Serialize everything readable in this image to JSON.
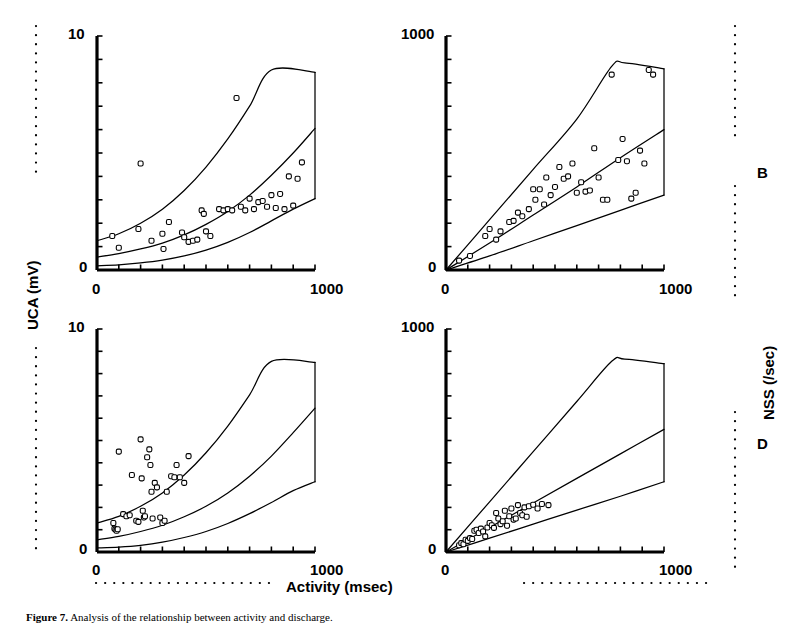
{
  "figure": {
    "caption_lead": "Figure 7.",
    "caption_rest": "Analysis of the relationship between activity and discharge."
  },
  "axes_titles": {
    "y_left": "UCA (mV)",
    "y_right": "NSS (/sec)",
    "x_bottom": "Activity (msec)"
  },
  "panel_letters": {
    "right_top": "B",
    "right_bottom": "D"
  },
  "ticks": {
    "uca_max": "10",
    "uca_min": "0",
    "nss_max": "1000",
    "nss_min": "0",
    "x_min": "0",
    "x_max": "1000"
  },
  "chart_data": [
    {
      "id": "panel-A",
      "type": "scatter",
      "title": "",
      "xlabel": "Activity (msec)",
      "ylabel": "UCA (mV)",
      "xlim": [
        0,
        1000
      ],
      "ylim": [
        0,
        10
      ],
      "grid": false,
      "legend": "none",
      "x_ticks": [
        "0",
        "1000"
      ],
      "y_ticks": [
        "0",
        "10"
      ],
      "x_minor_tick_count": 10,
      "y_minor_tick_count": 10,
      "marker": "open-square",
      "points": [
        [
          70,
          1.45
        ],
        [
          100,
          0.95
        ],
        [
          190,
          1.75
        ],
        [
          200,
          4.55
        ],
        [
          250,
          1.25
        ],
        [
          300,
          1.55
        ],
        [
          305,
          0.9
        ],
        [
          330,
          2.05
        ],
        [
          390,
          1.6
        ],
        [
          400,
          1.4
        ],
        [
          420,
          1.2
        ],
        [
          440,
          1.25
        ],
        [
          460,
          1.3
        ],
        [
          480,
          2.55
        ],
        [
          490,
          2.4
        ],
        [
          500,
          1.65
        ],
        [
          520,
          1.45
        ],
        [
          560,
          2.6
        ],
        [
          580,
          2.55
        ],
        [
          600,
          2.6
        ],
        [
          620,
          2.55
        ],
        [
          640,
          7.35
        ],
        [
          660,
          2.7
        ],
        [
          680,
          2.55
        ],
        [
          700,
          3.05
        ],
        [
          720,
          2.6
        ],
        [
          740,
          2.9
        ],
        [
          760,
          2.95
        ],
        [
          780,
          2.7
        ],
        [
          800,
          3.2
        ],
        [
          820,
          2.65
        ],
        [
          840,
          3.25
        ],
        [
          860,
          2.6
        ],
        [
          880,
          4.0
        ],
        [
          900,
          2.75
        ],
        [
          920,
          3.9
        ],
        [
          940,
          4.6
        ]
      ],
      "curves": [
        {
          "name": "upper-envelope",
          "points": [
            [
              0,
              1.25
            ],
            [
              100,
              1.55
            ],
            [
              200,
              2.0
            ],
            [
              300,
              2.6
            ],
            [
              400,
              3.4
            ],
            [
              500,
              4.4
            ],
            [
              600,
              5.6
            ],
            [
              700,
              7.0
            ],
            [
              800,
              8.55
            ],
            [
              1000,
              8.45
            ]
          ]
        },
        {
          "name": "median-fit",
          "points": [
            [
              0,
              0.55
            ],
            [
              100,
              0.7
            ],
            [
              200,
              0.9
            ],
            [
              300,
              1.15
            ],
            [
              400,
              1.5
            ],
            [
              500,
              1.95
            ],
            [
              600,
              2.5
            ],
            [
              700,
              3.2
            ],
            [
              800,
              4.05
            ],
            [
              900,
              5.0
            ],
            [
              1000,
              6.05
            ]
          ]
        },
        {
          "name": "lower-envelope",
          "points": [
            [
              0,
              0.18
            ],
            [
              100,
              0.22
            ],
            [
              200,
              0.3
            ],
            [
              300,
              0.42
            ],
            [
              400,
              0.6
            ],
            [
              500,
              0.85
            ],
            [
              600,
              1.18
            ],
            [
              700,
              1.6
            ],
            [
              800,
              2.1
            ],
            [
              900,
              2.6
            ],
            [
              1000,
              3.05
            ]
          ]
        },
        {
          "name": "right-closure",
          "points": [
            [
              1000,
              8.45
            ],
            [
              1000,
              3.05
            ]
          ]
        }
      ]
    },
    {
      "id": "panel-B",
      "type": "scatter",
      "title": "",
      "xlabel": "Activity (msec)",
      "ylabel": "NSS (/sec)",
      "xlim": [
        0,
        1000
      ],
      "ylim": [
        0,
        1000
      ],
      "grid": false,
      "legend": "none",
      "x_ticks": [
        "0",
        "1000"
      ],
      "y_ticks": [
        "0",
        "1000"
      ],
      "x_minor_tick_count": 10,
      "y_minor_tick_count": 10,
      "marker": "open-square",
      "points": [
        [
          60,
          40
        ],
        [
          110,
          60
        ],
        [
          180,
          145
        ],
        [
          200,
          175
        ],
        [
          230,
          130
        ],
        [
          250,
          165
        ],
        [
          290,
          205
        ],
        [
          310,
          210
        ],
        [
          330,
          245
        ],
        [
          350,
          230
        ],
        [
          380,
          260
        ],
        [
          400,
          345
        ],
        [
          410,
          300
        ],
        [
          430,
          345
        ],
        [
          450,
          280
        ],
        [
          460,
          395
        ],
        [
          480,
          320
        ],
        [
          500,
          355
        ],
        [
          520,
          440
        ],
        [
          540,
          390
        ],
        [
          560,
          400
        ],
        [
          580,
          455
        ],
        [
          600,
          330
        ],
        [
          620,
          375
        ],
        [
          640,
          335
        ],
        [
          660,
          340
        ],
        [
          680,
          520
        ],
        [
          700,
          395
        ],
        [
          720,
          300
        ],
        [
          740,
          300
        ],
        [
          760,
          835
        ],
        [
          790,
          470
        ],
        [
          810,
          560
        ],
        [
          830,
          465
        ],
        [
          850,
          305
        ],
        [
          870,
          330
        ],
        [
          890,
          510
        ],
        [
          910,
          455
        ],
        [
          930,
          855
        ],
        [
          950,
          835
        ]
      ],
      "curves": [
        {
          "name": "upper-envelope",
          "points": [
            [
              0,
              0
            ],
            [
              200,
              215
            ],
            [
              400,
              430
            ],
            [
              600,
              645
            ],
            [
              760,
              870
            ],
            [
              820,
              885
            ],
            [
              1000,
              860
            ]
          ]
        },
        {
          "name": "median-fit",
          "points": [
            [
              0,
              0
            ],
            [
              200,
              115
            ],
            [
              400,
              235
            ],
            [
              600,
              355
            ],
            [
              800,
              480
            ],
            [
              1000,
              600
            ]
          ]
        },
        {
          "name": "lower-envelope",
          "points": [
            [
              0,
              0
            ],
            [
              200,
              60
            ],
            [
              400,
              125
            ],
            [
              600,
              190
            ],
            [
              800,
              255
            ],
            [
              1000,
              320
            ]
          ]
        },
        {
          "name": "right-closure",
          "points": [
            [
              1000,
              860
            ],
            [
              1000,
              320
            ]
          ]
        }
      ]
    },
    {
      "id": "panel-C",
      "type": "scatter",
      "title": "",
      "xlabel": "Activity (msec)",
      "ylabel": "UCA (mV)",
      "xlim": [
        0,
        1000
      ],
      "ylim": [
        0,
        10
      ],
      "grid": false,
      "legend": "none",
      "x_ticks": [
        "0",
        "1000"
      ],
      "y_ticks": [
        "0",
        "10"
      ],
      "x_minor_tick_count": 10,
      "y_minor_tick_count": 10,
      "marker": "open-square",
      "points": [
        [
          75,
          1.3
        ],
        [
          80,
          1.05
        ],
        [
          85,
          1.0
        ],
        [
          90,
          0.95
        ],
        [
          95,
          1.02
        ],
        [
          100,
          4.5
        ],
        [
          120,
          1.7
        ],
        [
          135,
          1.6
        ],
        [
          150,
          1.65
        ],
        [
          160,
          3.45
        ],
        [
          180,
          1.4
        ],
        [
          190,
          1.35
        ],
        [
          200,
          5.05
        ],
        [
          205,
          3.3
        ],
        [
          210,
          1.85
        ],
        [
          215,
          1.55
        ],
        [
          220,
          1.6
        ],
        [
          230,
          4.25
        ],
        [
          240,
          4.6
        ],
        [
          245,
          3.9
        ],
        [
          250,
          2.7
        ],
        [
          255,
          1.5
        ],
        [
          265,
          3.1
        ],
        [
          275,
          2.9
        ],
        [
          290,
          1.55
        ],
        [
          300,
          1.3
        ],
        [
          310,
          1.4
        ],
        [
          320,
          2.7
        ],
        [
          340,
          3.4
        ],
        [
          355,
          3.35
        ],
        [
          365,
          3.9
        ],
        [
          380,
          3.35
        ],
        [
          400,
          3.1
        ],
        [
          420,
          4.3
        ]
      ],
      "curves": [
        {
          "name": "upper-envelope",
          "points": [
            [
              0,
              1.3
            ],
            [
              100,
              1.6
            ],
            [
              200,
              2.05
            ],
            [
              300,
              2.65
            ],
            [
              400,
              3.45
            ],
            [
              500,
              4.45
            ],
            [
              600,
              5.65
            ],
            [
              700,
              7.05
            ],
            [
              800,
              8.55
            ],
            [
              1000,
              8.5
            ]
          ]
        },
        {
          "name": "median-fit",
          "points": [
            [
              0,
              0.55
            ],
            [
              100,
              0.7
            ],
            [
              200,
              0.92
            ],
            [
              300,
              1.2
            ],
            [
              400,
              1.58
            ],
            [
              500,
              2.05
            ],
            [
              600,
              2.65
            ],
            [
              700,
              3.4
            ],
            [
              800,
              4.3
            ],
            [
              900,
              5.35
            ],
            [
              1000,
              6.45
            ]
          ]
        },
        {
          "name": "lower-envelope",
          "points": [
            [
              0,
              0.18
            ],
            [
              100,
              0.22
            ],
            [
              200,
              0.3
            ],
            [
              300,
              0.44
            ],
            [
              400,
              0.65
            ],
            [
              500,
              0.92
            ],
            [
              600,
              1.28
            ],
            [
              700,
              1.72
            ],
            [
              800,
              2.22
            ],
            [
              900,
              2.75
            ],
            [
              1000,
              3.15
            ]
          ]
        },
        {
          "name": "right-closure",
          "points": [
            [
              1000,
              8.5
            ],
            [
              1000,
              3.15
            ]
          ]
        }
      ]
    },
    {
      "id": "panel-D",
      "type": "scatter",
      "title": "",
      "xlabel": "Activity (msec)",
      "ylabel": "NSS (/sec)",
      "xlim": [
        0,
        1000
      ],
      "ylim": [
        0,
        1000
      ],
      "grid": false,
      "legend": "none",
      "x_ticks": [
        "0",
        "1000"
      ],
      "y_ticks": [
        "0",
        "1000"
      ],
      "x_minor_tick_count": 10,
      "y_minor_tick_count": 10,
      "marker": "open-square",
      "points": [
        [
          60,
          30
        ],
        [
          70,
          40
        ],
        [
          80,
          35
        ],
        [
          90,
          55
        ],
        [
          100,
          50
        ],
        [
          110,
          62
        ],
        [
          120,
          58
        ],
        [
          130,
          95
        ],
        [
          140,
          100
        ],
        [
          150,
          85
        ],
        [
          160,
          105
        ],
        [
          170,
          92
        ],
        [
          180,
          70
        ],
        [
          190,
          110
        ],
        [
          200,
          130
        ],
        [
          210,
          120
        ],
        [
          220,
          108
        ],
        [
          230,
          175
        ],
        [
          240,
          150
        ],
        [
          250,
          125
        ],
        [
          260,
          138
        ],
        [
          270,
          185
        ],
        [
          280,
          118
        ],
        [
          290,
          160
        ],
        [
          300,
          195
        ],
        [
          310,
          145
        ],
        [
          320,
          150
        ],
        [
          330,
          210
        ],
        [
          340,
          175
        ],
        [
          350,
          165
        ],
        [
          360,
          200
        ],
        [
          370,
          158
        ],
        [
          380,
          205
        ],
        [
          400,
          212
        ],
        [
          420,
          195
        ],
        [
          440,
          215
        ],
        [
          470,
          210
        ]
      ],
      "curves": [
        {
          "name": "upper-envelope",
          "points": [
            [
              0,
              0
            ],
            [
              200,
              225
            ],
            [
              400,
              450
            ],
            [
              600,
              675
            ],
            [
              760,
              855
            ],
            [
              820,
              865
            ],
            [
              1000,
              845
            ]
          ]
        },
        {
          "name": "median-fit",
          "points": [
            [
              0,
              0
            ],
            [
              200,
              110
            ],
            [
              400,
              220
            ],
            [
              600,
              330
            ],
            [
              800,
              440
            ],
            [
              1000,
              550
            ]
          ]
        },
        {
          "name": "lower-envelope",
          "points": [
            [
              0,
              0
            ],
            [
              200,
              62
            ],
            [
              400,
              125
            ],
            [
              600,
              188
            ],
            [
              800,
              250
            ],
            [
              1000,
              315
            ]
          ]
        },
        {
          "name": "right-closure",
          "points": [
            [
              1000,
              845
            ],
            [
              1000,
              315
            ]
          ]
        }
      ]
    }
  ]
}
